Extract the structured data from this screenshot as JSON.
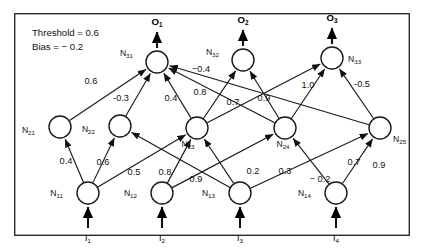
{
  "diagram": {
    "params": [
      {
        "id": "threshold",
        "text": "Threshold = 0.6"
      },
      {
        "id": "bias",
        "text": "Bias = − 0.2"
      }
    ],
    "colors": {
      "stroke": "#1a1a1a",
      "frame": "#2b2b2b",
      "node_fill": "#ffffff",
      "background": "#ffffff"
    },
    "layers": [
      {
        "name": "input-layer",
        "nodes": [
          {
            "id": "N11",
            "base": "N",
            "sub": "11",
            "cx": 88,
            "cy": 193,
            "r": 11,
            "label_x": 63,
            "label_y": 196,
            "label_anchor": "end"
          },
          {
            "id": "N12",
            "base": "N",
            "sub": "12",
            "cx": 162,
            "cy": 193,
            "r": 11,
            "label_x": 137,
            "label_y": 196,
            "label_anchor": "end"
          },
          {
            "id": "N13",
            "base": "N",
            "sub": "13",
            "cx": 240,
            "cy": 193,
            "r": 11,
            "label_x": 215,
            "label_y": 196,
            "label_anchor": "end"
          },
          {
            "id": "N14",
            "base": "N",
            "sub": "14",
            "cx": 336,
            "cy": 193,
            "r": 11,
            "label_x": 311,
            "label_y": 196,
            "label_anchor": "end"
          }
        ]
      },
      {
        "name": "hidden-layer",
        "nodes": [
          {
            "id": "N21",
            "base": "N",
            "sub": "21",
            "cx": 60,
            "cy": 127,
            "r": 11,
            "label_x": 35,
            "label_y": 133,
            "label_anchor": "end"
          },
          {
            "id": "N22",
            "base": "N",
            "sub": "22",
            "cx": 120,
            "cy": 126,
            "r": 11,
            "label_x": 95,
            "label_y": 132,
            "label_anchor": "end"
          },
          {
            "id": "N23",
            "base": "N",
            "sub": "23",
            "cx": 197,
            "cy": 128,
            "r": 11,
            "label_x": 188,
            "label_y": 147,
            "label_anchor": "middle"
          },
          {
            "id": "N24",
            "base": "N",
            "sub": "24",
            "cx": 285,
            "cy": 128,
            "r": 11,
            "label_x": 283,
            "label_y": 147,
            "label_anchor": "middle"
          },
          {
            "id": "N25",
            "base": "N",
            "sub": "25",
            "cx": 380,
            "cy": 128,
            "r": 11,
            "label_x": 393,
            "label_y": 142,
            "label_anchor": "start"
          }
        ]
      },
      {
        "name": "output-layer",
        "nodes": [
          {
            "id": "N31",
            "base": "N",
            "sub": "31",
            "cx": 157,
            "cy": 62,
            "r": 11,
            "label_x": 133,
            "label_y": 56,
            "label_anchor": "end"
          },
          {
            "id": "N32",
            "base": "N",
            "sub": "32",
            "cx": 243,
            "cy": 60,
            "r": 11,
            "label_x": 219,
            "label_y": 55,
            "label_anchor": "end"
          },
          {
            "id": "N33",
            "base": "N",
            "sub": "33",
            "cx": 332,
            "cy": 58,
            "r": 11,
            "label_x": 348,
            "label_y": 62,
            "label_anchor": "start"
          }
        ]
      }
    ],
    "inputs": [
      {
        "id": "I1",
        "base": "I",
        "sub": "1",
        "x": 88,
        "y_from": 228,
        "y_to": 207,
        "label_x": 88,
        "label_y": 241
      },
      {
        "id": "I2",
        "base": "I",
        "sub": "2",
        "x": 162,
        "y_from": 228,
        "y_to": 207,
        "label_x": 162,
        "label_y": 241
      },
      {
        "id": "I3",
        "base": "I",
        "sub": "3",
        "x": 240,
        "y_from": 228,
        "y_to": 207,
        "label_x": 240,
        "label_y": 241
      },
      {
        "id": "I4",
        "base": "I",
        "sub": "4",
        "x": 336,
        "y_from": 228,
        "y_to": 207,
        "label_x": 336,
        "label_y": 241
      }
    ],
    "outputs": [
      {
        "id": "O1",
        "base": "O",
        "sub": "1",
        "x": 157,
        "y_from": 48,
        "y_to": 32,
        "label_x": 157,
        "label_y": 25
      },
      {
        "id": "O2",
        "base": "O",
        "sub": "2",
        "x": 243,
        "y_from": 46,
        "y_to": 30,
        "label_x": 243,
        "label_y": 23
      },
      {
        "id": "O3",
        "base": "O",
        "sub": "3",
        "x": 332,
        "y_from": 44,
        "y_to": 28,
        "label_x": 332,
        "label_y": 21
      }
    ],
    "edges": [
      {
        "id": "e-N11-N21",
        "from": "N11",
        "to": "N21",
        "weight": "0.4",
        "wx": 66,
        "wy": 164
      },
      {
        "id": "e-N11-N22",
        "from": "N11",
        "to": "N22",
        "weight": "0.6",
        "wx": 103,
        "wy": 165
      },
      {
        "id": "e-N11-N23",
        "from": "N11",
        "to": "N23",
        "weight": "0.5",
        "wx": 134,
        "wy": 175
      },
      {
        "id": "e-N12-N23",
        "from": "N12",
        "to": "N23",
        "weight": "0.8",
        "wx": 165,
        "wy": 175
      },
      {
        "id": "e-N12-N24",
        "from": "N12",
        "to": "N24",
        "weight": "0.9",
        "wx": 196,
        "wy": 182
      },
      {
        "id": "e-N13-N22",
        "from": "N13",
        "to": "N22",
        "weight": "0.2",
        "wx": 253,
        "wy": 174
      },
      {
        "id": "e-N13-N23",
        "from": "N13",
        "to": "N23",
        "weight": "0.3",
        "wx": 285,
        "wy": 174
      },
      {
        "id": "e-N13-N25",
        "from": "N13",
        "to": "N25",
        "weight": "− 0.2",
        "wx": 320,
        "wy": 182
      },
      {
        "id": "e-N14-N24",
        "from": "N14",
        "to": "N24",
        "weight": "0.7",
        "wx": 354,
        "wy": 165
      },
      {
        "id": "e-N14-N25",
        "from": "N14",
        "to": "N25",
        "weight": "0.9",
        "wx": 379,
        "wy": 168
      },
      {
        "id": "e-N21-N31",
        "from": "N21",
        "to": "N31",
        "weight": "0.6",
        "wx": 91,
        "wy": 84
      },
      {
        "id": "e-N22-N31",
        "from": "N22",
        "to": "N31",
        "weight": "-0.3",
        "wx": 121,
        "wy": 101
      },
      {
        "id": "e-N23-N31",
        "from": "N23",
        "to": "N31",
        "weight": "0.4",
        "wx": 171,
        "wy": 101
      },
      {
        "id": "e-N23-N32",
        "from": "N23",
        "to": "N32",
        "weight": "0.8",
        "wx": 200,
        "wy": 95
      },
      {
        "id": "e-N24-N32",
        "from": "N24",
        "to": "N32",
        "weight": "0.7",
        "wx": 233,
        "wy": 105
      },
      {
        "id": "e-N24-N33",
        "from": "N24",
        "to": "N33",
        "weight": "0.9",
        "wx": 264,
        "wy": 101
      },
      {
        "id": "e-N23-N33",
        "from": "N23",
        "to": "N33",
        "weight": "1.0",
        "wx": 308,
        "wy": 88
      },
      {
        "id": "e-N25-N31",
        "from": "N25",
        "to": "N31",
        "weight": "−0.4",
        "wx": 201,
        "wy": 72
      },
      {
        "id": "e-N25-N33",
        "from": "N25",
        "to": "N33",
        "weight": "-0.5",
        "wx": 362,
        "wy": 87
      },
      {
        "id": "e-N24-N31",
        "from": "N24",
        "to": "N31",
        "weight": "",
        "wx": 0,
        "wy": 0
      }
    ],
    "frame": {
      "x": 14,
      "y": 13,
      "width": 396,
      "height": 223
    }
  }
}
